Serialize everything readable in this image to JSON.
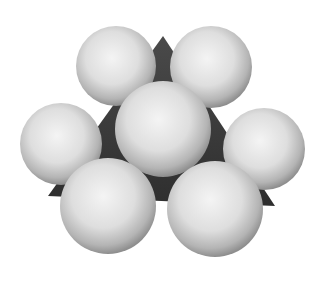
{
  "image": {
    "subject": "space-filling model of seven spheres arranged around a dark triangular core",
    "background": "#ffffff",
    "core_color": "#3a3a3a",
    "sphere_color_light": "#f2f2f2",
    "sphere_color_dark": "#8c8c8c"
  },
  "core": {
    "points": "163,36 48,196 275,206"
  },
  "spheres": [
    {
      "name": "sphere-top-left",
      "cx": 116,
      "cy": 66,
      "r": 40
    },
    {
      "name": "sphere-top-right",
      "cx": 211,
      "cy": 67,
      "r": 41
    },
    {
      "name": "sphere-left",
      "cx": 61,
      "cy": 144,
      "r": 41
    },
    {
      "name": "sphere-right",
      "cx": 264,
      "cy": 149,
      "r": 41
    },
    {
      "name": "sphere-center",
      "cx": 163,
      "cy": 129,
      "r": 48
    },
    {
      "name": "sphere-bottom-left",
      "cx": 108,
      "cy": 206,
      "r": 48
    },
    {
      "name": "sphere-bottom-right",
      "cx": 215,
      "cy": 209,
      "r": 48
    }
  ]
}
